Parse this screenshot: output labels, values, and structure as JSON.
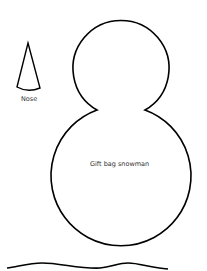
{
  "template": {
    "title": "Gift bag snowman",
    "nose_label": "Nose"
  },
  "colors": {
    "outline": "#000000",
    "background": "#ffffff",
    "text": "#333333"
  }
}
